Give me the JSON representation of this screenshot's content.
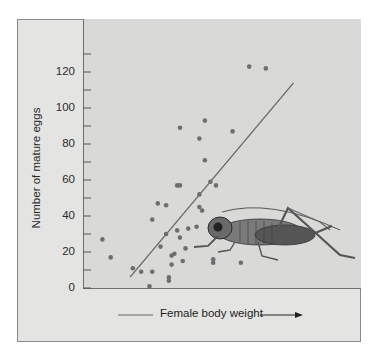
{
  "chart_data": {
    "type": "scatter",
    "title": "",
    "xlabel": "Female body weight",
    "ylabel": "Number of mature eggs",
    "x_axis_note": "No numeric x-axis scale; arrow indicates increasing weight. x values given as relative position 0-100 along the axis.",
    "ylim": [
      0,
      140
    ],
    "yticks": [
      0,
      20,
      40,
      60,
      80,
      100,
      120
    ],
    "ytick_labels": [
      "0",
      "20",
      "40",
      "60",
      "80",
      "100",
      "120"
    ],
    "minor_ticks": [
      10,
      30,
      50,
      70,
      90,
      110,
      130
    ],
    "grid": false,
    "legend": null,
    "series": [
      {
        "name": "Females",
        "points": [
          {
            "x": 7,
            "y": 27
          },
          {
            "x": 10,
            "y": 17
          },
          {
            "x": 18,
            "y": 11
          },
          {
            "x": 21,
            "y": 9
          },
          {
            "x": 24,
            "y": 1
          },
          {
            "x": 25,
            "y": 9
          },
          {
            "x": 25,
            "y": 38
          },
          {
            "x": 27,
            "y": 47
          },
          {
            "x": 28,
            "y": 23
          },
          {
            "x": 30,
            "y": 46
          },
          {
            "x": 30,
            "y": 30
          },
          {
            "x": 31,
            "y": 4
          },
          {
            "x": 31,
            "y": 6
          },
          {
            "x": 32,
            "y": 13
          },
          {
            "x": 32,
            "y": 18
          },
          {
            "x": 33,
            "y": 19
          },
          {
            "x": 34,
            "y": 57
          },
          {
            "x": 35,
            "y": 57
          },
          {
            "x": 34,
            "y": 32
          },
          {
            "x": 35,
            "y": 28
          },
          {
            "x": 35,
            "y": 89
          },
          {
            "x": 36,
            "y": 15
          },
          {
            "x": 37,
            "y": 22
          },
          {
            "x": 38,
            "y": 33
          },
          {
            "x": 41,
            "y": 34
          },
          {
            "x": 42,
            "y": 83
          },
          {
            "x": 42,
            "y": 52
          },
          {
            "x": 42,
            "y": 45
          },
          {
            "x": 43,
            "y": 43
          },
          {
            "x": 44,
            "y": 93
          },
          {
            "x": 44,
            "y": 71
          },
          {
            "x": 46,
            "y": 59
          },
          {
            "x": 47,
            "y": 16
          },
          {
            "x": 47,
            "y": 14
          },
          {
            "x": 48,
            "y": 57
          },
          {
            "x": 54,
            "y": 87
          },
          {
            "x": 57,
            "y": 14
          },
          {
            "x": 60,
            "y": 123
          },
          {
            "x": 66,
            "y": 122
          }
        ]
      }
    ],
    "regression_line": {
      "from": {
        "x": 17,
        "y": 6
      },
      "to": {
        "x": 76,
        "y": 114
      }
    },
    "annotation": "Illustration of a cricket (katydid) in lower right of plot"
  },
  "labels": {
    "ylabel": "Number of mature eggs",
    "xlabel": "Female body weight"
  },
  "ticks": [
    {
      "label": "120",
      "top": 65
    },
    {
      "label": "100",
      "top": 101
    },
    {
      "label": "80",
      "top": 137
    },
    {
      "label": "60",
      "top": 173
    },
    {
      "label": "40",
      "top": 208
    },
    {
      "label": "20",
      "top": 244
    },
    {
      "label": "0",
      "top": 281
    }
  ],
  "colors": {
    "frame_bg": "#e4e4e2",
    "plot_bg": "#d9d9d7",
    "point": "#6e6e6e",
    "line": "#666666"
  }
}
